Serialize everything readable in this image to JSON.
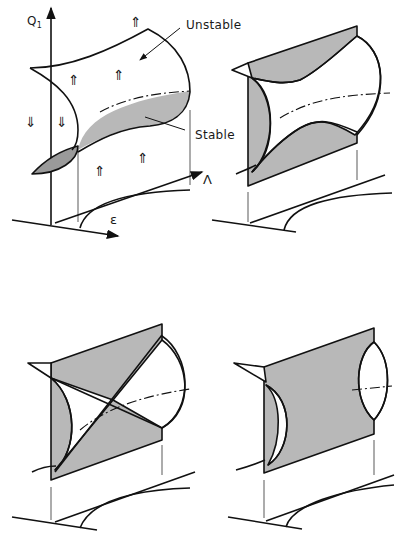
{
  "figure": {
    "panels": [
      {
        "id": "a",
        "labels": {
          "y_axis": "Q",
          "y_axis_subscript": "1",
          "x_axis": "ε",
          "z_axis": "Λ",
          "unstable": "Unstable",
          "stable": "Stable"
        },
        "flow_arrows": {
          "up": "⇑",
          "down": "⇓"
        }
      },
      {
        "id": "b"
      },
      {
        "id": "c"
      },
      {
        "id": "d"
      }
    ],
    "colors": {
      "line": "#111111",
      "shade": "#b8b8b8",
      "background": "#ffffff"
    }
  }
}
